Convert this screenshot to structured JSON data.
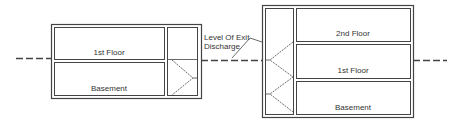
{
  "diagram": {
    "left_building": {
      "floors": [
        {
          "label": "1st Floor"
        },
        {
          "label": "Basement"
        }
      ]
    },
    "right_building": {
      "floors": [
        {
          "label": "2nd Floor"
        },
        {
          "label": "1st Floor"
        },
        {
          "label": "Basement"
        }
      ]
    },
    "callout": {
      "line1": "Level Of Exit",
      "line2": "Discharge"
    },
    "colors": {
      "line": "#444444",
      "background": "#ffffff"
    }
  }
}
